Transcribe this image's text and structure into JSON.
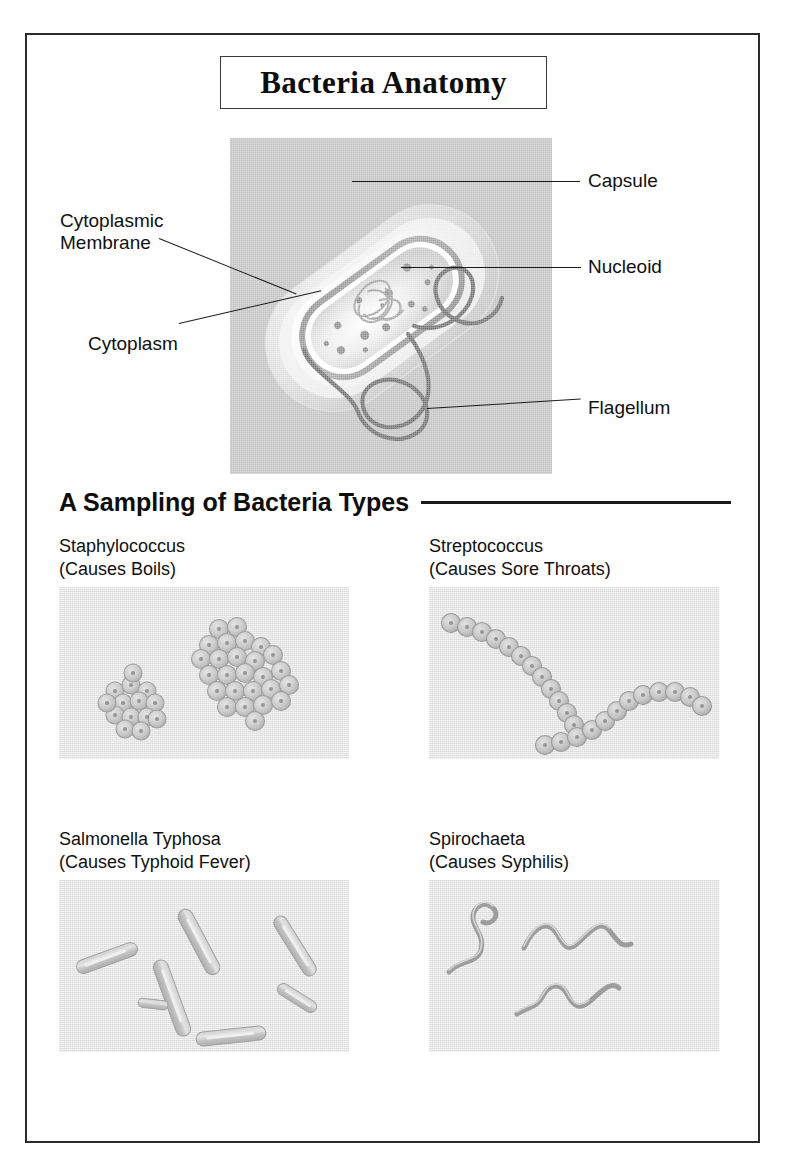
{
  "page": {
    "title": "Bacteria Anatomy",
    "border_color": "#2b2b2b",
    "background": "#ffffff"
  },
  "anatomy": {
    "panel_background": "#c2c2c2",
    "organism": "rod-shaped bacterium (bacillus) shown in cutaway",
    "labels": [
      {
        "id": "capsule",
        "text": "Capsule",
        "side": "right"
      },
      {
        "id": "nucleoid",
        "text": "Nucleoid",
        "side": "right"
      },
      {
        "id": "flagellum",
        "text": "Flagellum",
        "side": "right"
      },
      {
        "id": "cytoplasmic-membrane",
        "text": "Cytoplasmic\nMembrane",
        "side": "left"
      },
      {
        "id": "cytoplasm",
        "text": "Cytoplasm",
        "side": "left"
      }
    ],
    "structures": [
      "capsule",
      "cell wall",
      "cytoplasmic membrane",
      "cytoplasm",
      "granules",
      "nucleoid",
      "flagella"
    ]
  },
  "section": {
    "heading": "A Sampling of Bacteria Types",
    "rule_color": "#1a1a1a"
  },
  "specimens": [
    {
      "id": "staphylococcus",
      "name": "Staphylococcus",
      "disease": "(Causes Boils)",
      "caption": "Staphylococcus\n(Causes Boils)",
      "shape": "cocci in grape-like clusters",
      "cluster_count": 2,
      "cell_count": 40
    },
    {
      "id": "streptococcus",
      "name": "Streptococcus",
      "disease": "(Causes Sore Throats)",
      "caption": "Streptococcus\n(Causes Sore Throats)",
      "shape": "cocci in chains",
      "chain_count": 2,
      "cell_count": 24
    },
    {
      "id": "salmonella-typhosa",
      "name": "Salmonella Typhosa",
      "disease": "(Causes Typhoid Fever)",
      "caption": "Salmonella Typhosa\n(Causes Typhoid Fever)",
      "shape": "rod-shaped bacilli, scattered",
      "cell_count": 8
    },
    {
      "id": "spirochaeta",
      "name": "Spirochaeta",
      "disease": "(Causes Syphilis)",
      "caption": "Spirochaeta\n(Causes Syphilis)",
      "shape": "long helical spiral filaments",
      "cell_count": 3
    }
  ]
}
